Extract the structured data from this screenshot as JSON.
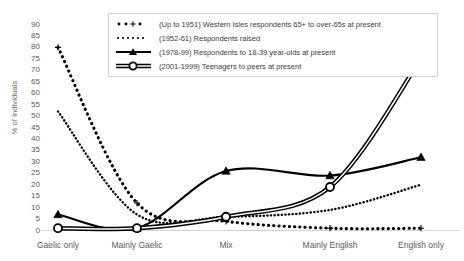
{
  "chart_data": {
    "type": "line",
    "title": "",
    "xlabel": "",
    "ylabel": "% of individuals",
    "categories": [
      "Gaelic only",
      "Mainly Gaelic",
      "Mix",
      "Mainly English",
      "English only"
    ],
    "ylim": [
      0,
      90
    ],
    "ytick_step": 5,
    "yticks": [
      90,
      85,
      80,
      75,
      70,
      65,
      60,
      55,
      50,
      45,
      40,
      35,
      30,
      25,
      20,
      15,
      10,
      5,
      0
    ],
    "grid": false,
    "legend_position": "top-center",
    "series": [
      {
        "name": "(Up to 1951) Western Isles respondents 65+ to over-65s at present",
        "marker": "plus",
        "line": "dotted",
        "color": "#000000",
        "values": [
          80,
          12,
          4,
          1,
          1
        ]
      },
      {
        "name": "(1952-61) Respondents raised",
        "marker": "dot",
        "line": "dotted",
        "color": "#000000",
        "values": [
          52,
          7,
          6,
          9,
          20
        ]
      },
      {
        "name": "(1978-99) Respondents to 18-39 year-olds at present",
        "marker": "triangle",
        "line": "solid",
        "color": "#000000",
        "values": [
          7,
          1,
          26,
          24,
          32
        ]
      },
      {
        "name": "(2001-1999) Teenagers to peers at present",
        "marker": "circle",
        "line": "solid-double",
        "color": "#000000",
        "values": [
          1,
          1,
          6,
          19,
          75
        ]
      }
    ]
  },
  "legend": {
    "items": [
      {
        "label": "(Up to 1951) Western Isles respondents 65+ to over-65s at present",
        "symbol": "dotted-plus"
      },
      {
        "label": "(1952-61) Respondents raised",
        "symbol": "dotted-dots"
      },
      {
        "label": "(1978-99) Respondents to 18-39 year-olds at present",
        "symbol": "solid-triangle"
      },
      {
        "label": "(2001-1999) Teenagers to peers at present",
        "symbol": "double-circle"
      }
    ]
  },
  "axes": {
    "y_title": "% of individuals"
  }
}
